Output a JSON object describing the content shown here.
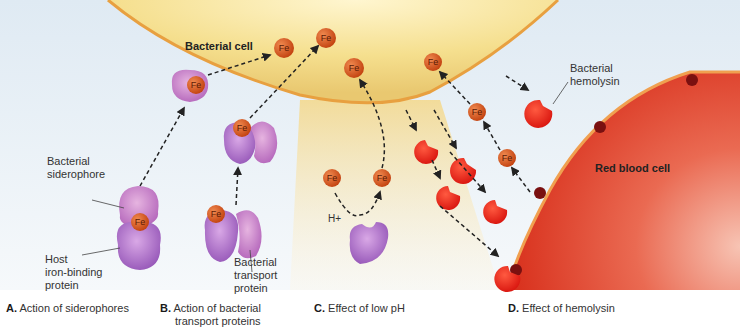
{
  "figure": {
    "regions": {
      "bacterial_cell": "Bacterial cell",
      "red_blood_cell": "Red blood cell"
    },
    "labels": {
      "bacterial_siderophore": [
        "Bacterial",
        "siderophore"
      ],
      "host_iron_binding_protein": [
        "Host",
        "iron-binding",
        "protein"
      ],
      "bacterial_transport_protein": [
        "Bacterial",
        "transport",
        "protein"
      ],
      "bacterial_hemolysin": [
        "Bacterial",
        "hemolysin"
      ],
      "h_plus": "H+",
      "iron": "Fe"
    },
    "panels": [
      {
        "letter": "A.",
        "caption": "Action of siderophores"
      },
      {
        "letter": "B.",
        "caption": "Action of bacterial",
        "caption2": "transport proteins"
      },
      {
        "letter": "C.",
        "caption": "Effect of low pH"
      },
      {
        "letter": "D.",
        "caption": "Effect of hemolysin"
      }
    ],
    "colors": {
      "bacterial_cell_fill": "#f3dc86",
      "membrane": "#e8a040",
      "iron": "#d2521e",
      "protein": "#b06ac8",
      "hemolysin": "#e8261c",
      "rbc": "#e0402a",
      "background": "#e8f0f6"
    }
  }
}
